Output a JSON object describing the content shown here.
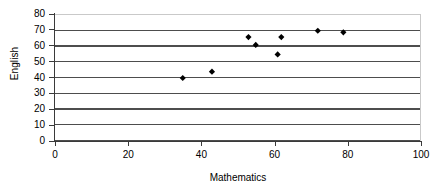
{
  "chart_data": {
    "type": "scatter",
    "title": "",
    "xlabel": "Mathematics",
    "ylabel": "English",
    "xlim": [
      0,
      100
    ],
    "ylim": [
      0,
      80
    ],
    "xticks": [
      0,
      20,
      40,
      60,
      80,
      100
    ],
    "yticks": [
      0,
      10,
      20,
      30,
      40,
      50,
      60,
      70,
      80
    ],
    "grid": "horizontal",
    "legend": "none",
    "series": [
      {
        "name": "Students",
        "points": [
          {
            "x": 35,
            "y": 40
          },
          {
            "x": 43,
            "y": 44
          },
          {
            "x": 53,
            "y": 66
          },
          {
            "x": 55,
            "y": 61
          },
          {
            "x": 61,
            "y": 55
          },
          {
            "x": 62,
            "y": 66
          },
          {
            "x": 72,
            "y": 70
          },
          {
            "x": 79,
            "y": 69
          }
        ],
        "marker": "diamond",
        "color": "#000000"
      }
    ]
  },
  "axes": {
    "x_title": "Mathematics",
    "y_title": "English",
    "x_tick_labels": [
      "0",
      "20",
      "40",
      "60",
      "80",
      "100"
    ],
    "y_tick_labels": [
      "0",
      "10",
      "20",
      "30",
      "40",
      "50",
      "60",
      "70",
      "80"
    ]
  },
  "colors": {
    "marker": "#000000",
    "gridline": "#4d4d4d",
    "axis": "#3a3a3a",
    "plot_border": "#c9c9c9",
    "background": "#ffffff"
  }
}
